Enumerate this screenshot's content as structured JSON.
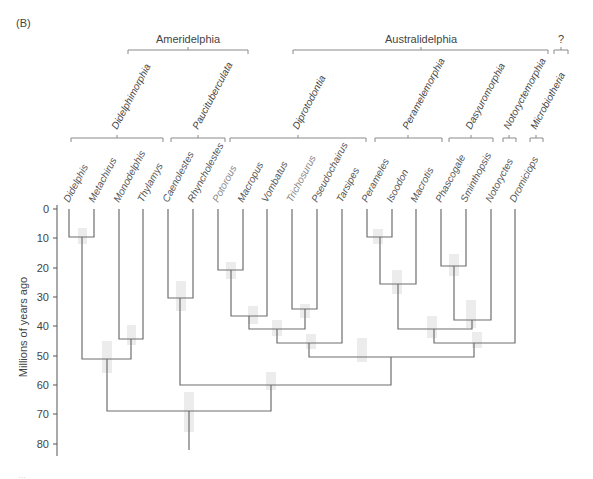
{
  "panel_label": "(B)",
  "caption_truncated": "…",
  "axis": {
    "label": "Millions of years ago",
    "ticks": [
      "0",
      "10",
      "20",
      "30",
      "40",
      "50",
      "60",
      "70",
      "80"
    ],
    "tick_values": [
      0,
      10,
      20,
      30,
      40,
      50,
      60,
      70,
      80
    ]
  },
  "superorders": [
    {
      "label": "Ameridelphia"
    },
    {
      "label": "Australidelphia"
    },
    {
      "label": "?"
    }
  ],
  "orders": [
    {
      "label": "Didelphimorphia"
    },
    {
      "label": "Paucituberculata"
    },
    {
      "label": "Diprotodontia"
    },
    {
      "label": "Peramelemorphia"
    },
    {
      "label": "Dasyuromorphia"
    },
    {
      "label": "Notoryctemorphia"
    },
    {
      "label": "Microbiotheria"
    }
  ],
  "taxa": [
    {
      "label": "Didelphis"
    },
    {
      "label": "Metachirus"
    },
    {
      "label": "Monodelphis"
    },
    {
      "label": "Thylamys"
    },
    {
      "label": "Caenolestes"
    },
    {
      "label": "Rhyncholestes"
    },
    {
      "label": "Potorous"
    },
    {
      "label": "Macropus"
    },
    {
      "label": "Vombatus"
    },
    {
      "label": "Trichosurus"
    },
    {
      "label": "Pseudochairus"
    },
    {
      "label": "Tarsipes"
    },
    {
      "label": "Perameles"
    },
    {
      "label": "Isoodon"
    },
    {
      "label": "Macrotis"
    },
    {
      "label": "Phascogale"
    },
    {
      "label": "Sminthopsis"
    },
    {
      "label": "Notoryctes"
    },
    {
      "label": "Dromiciops"
    }
  ],
  "divergence_ages_mya": {
    "Didelphis_Metachirus": 9.5,
    "Monodelphis_Thylamys": 44.5,
    "Didelphidae": 51.5,
    "Caenolestes_Rhyncholestes": 30,
    "Potorous_Macropus": 21,
    "Macropodiformes_Vombatus": 37,
    "Trichosurus_Pseudochairus": 34,
    "Diprotodontia_inner": 41,
    "Diprotodontia_Tarsipes": 46,
    "Perameles_Isoodon": 9.5,
    "Peramelidae_Macrotis": 25.5,
    "Phascogale_Sminthopsis": 19.5,
    "Dasyuromorphia_Notoryctes": 38,
    "Peramelemorphia_Dasyuromorphia": 41,
    "Australidelphia_Dromiciops": 46,
    "Diprotodontia_rest": 50.5,
    "Paucituberculata_Australidelphia": 60,
    "root": 69
  },
  "colors": {
    "line": "#6e6e6e",
    "text": "#444444",
    "ci_box": "#ebebeb"
  }
}
